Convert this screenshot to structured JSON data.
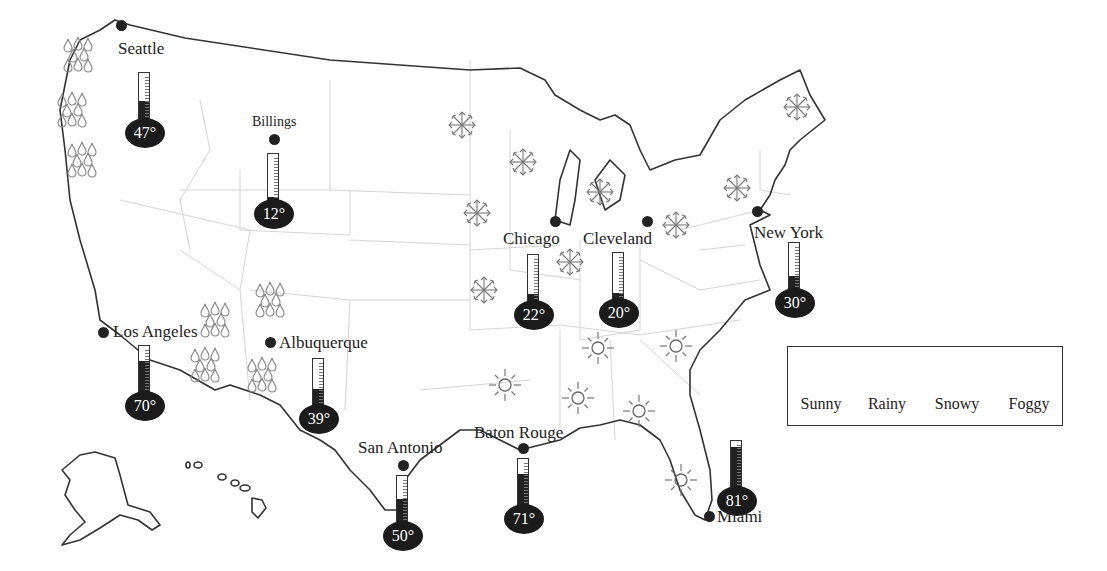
{
  "map": {
    "type": "weather-map",
    "region": "United States",
    "colors": {
      "outline": "#333333",
      "state_borders": "#d4d4d4",
      "thermometer": "#1b1b1b",
      "icon": "#777777"
    }
  },
  "cities": [
    {
      "name": "Seattle",
      "temp": "47°",
      "fill_pct": 45
    },
    {
      "name": "Billings",
      "temp": "12°",
      "fill_pct": 15
    },
    {
      "name": "Chicago",
      "temp": "22°",
      "fill_pct": 22
    },
    {
      "name": "Cleveland",
      "temp": "20°",
      "fill_pct": 20
    },
    {
      "name": "New York",
      "temp": "30°",
      "fill_pct": 35
    },
    {
      "name": "Los Angeles",
      "temp": "70°",
      "fill_pct": 70
    },
    {
      "name": "Albuquerque",
      "temp": "39°",
      "fill_pct": 40
    },
    {
      "name": "San Antonio",
      "temp": "50°",
      "fill_pct": 55
    },
    {
      "name": "Baton Rouge",
      "temp": "71°",
      "fill_pct": 70
    },
    {
      "name": "Miami",
      "temp": "81°",
      "fill_pct": 88
    }
  ],
  "legend": {
    "items": [
      {
        "icon": "sun-icon",
        "label": "Sunny"
      },
      {
        "icon": "rain-icon",
        "label": "Rainy"
      },
      {
        "icon": "snow-icon",
        "label": "Snowy"
      },
      {
        "icon": "fog-icon",
        "label": "Foggy"
      }
    ]
  }
}
